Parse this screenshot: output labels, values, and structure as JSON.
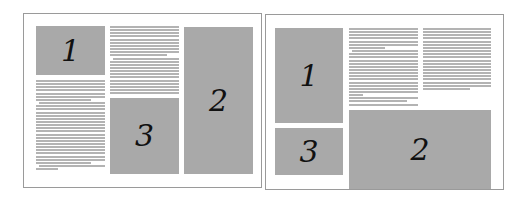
{
  "diagram": {
    "layouts": [
      {
        "name": "layout-a",
        "frame": {
          "x": 23,
          "y": 13,
          "w": 239,
          "h": 175
        },
        "boxes": [
          {
            "label": "1",
            "x": 36,
            "y": 26,
            "w": 69,
            "h": 49
          },
          {
            "label": "3",
            "x": 110,
            "y": 98,
            "w": 69,
            "h": 76
          },
          {
            "label": "2",
            "x": 184,
            "y": 27,
            "w": 69,
            "h": 147
          }
        ],
        "text_columns": [
          {
            "x": 36,
            "y": 80,
            "w": 69,
            "lines": 29,
            "short": {
              "6": 0.8,
              "26": 0.8,
              "28": 0.32
            },
            "indent": [
              7,
              27
            ]
          },
          {
            "x": 110,
            "y": 26,
            "w": 69,
            "lines": 22,
            "short": {
              "9": 0.83
            },
            "indent": [
              10
            ]
          }
        ]
      },
      {
        "name": "layout-b",
        "frame": {
          "x": 265,
          "y": 14,
          "w": 239,
          "h": 176
        },
        "boxes": [
          {
            "label": "1",
            "x": 275,
            "y": 28,
            "w": 68,
            "h": 95
          },
          {
            "label": "3",
            "x": 275,
            "y": 128,
            "w": 68,
            "h": 47
          },
          {
            "label": "2",
            "x": 349,
            "y": 110,
            "w": 142,
            "h": 79
          }
        ],
        "text_columns": [
          {
            "x": 349,
            "y": 28,
            "w": 69,
            "lines": 25,
            "short": {
              "6": 0.52,
              "21": 0.2,
              "23": 0.84
            },
            "indent": [
              7
            ]
          },
          {
            "x": 423,
            "y": 28,
            "w": 68,
            "lines": 20,
            "short": {
              "19": 0.69
            },
            "indent": []
          }
        ]
      }
    ],
    "colors": {
      "box_fill": "#a9a9a9",
      "text_line": "#b3b3b3",
      "frame_border": "#9a9a9a",
      "label": "#111111"
    }
  }
}
